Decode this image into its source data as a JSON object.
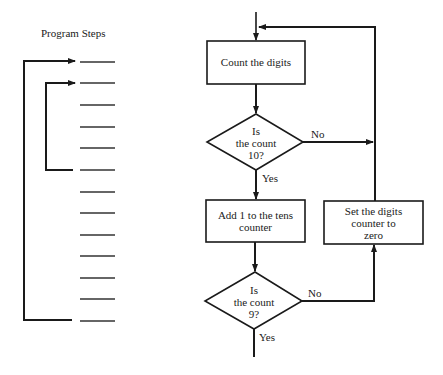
{
  "program_steps": {
    "title": "Program Steps",
    "step_count": 13,
    "step_y": [
      62,
      83,
      105,
      127,
      148,
      170,
      192,
      213,
      235,
      256,
      278,
      299,
      321
    ],
    "loops": [
      {
        "name": "outer-loop",
        "from_step": 13,
        "to_step": 1
      },
      {
        "name": "inner-loop",
        "from_step": 6,
        "to_step": 2
      }
    ]
  },
  "flowchart": {
    "nodes": {
      "count_digits": {
        "type": "process",
        "label": "Count the digits"
      },
      "is_count_10": {
        "type": "decision",
        "line1": "Is",
        "line2": "the count",
        "line3": "10?"
      },
      "add_tens": {
        "type": "process",
        "line1": "Add 1 to the tens",
        "line2": "counter"
      },
      "reset_digits": {
        "type": "process",
        "line1": "Set the digits",
        "line2": "counter to",
        "line3": "zero"
      },
      "is_count_9": {
        "type": "decision",
        "line1": "Is",
        "line2": "the count",
        "line3": "9?"
      }
    },
    "edge_labels": {
      "d1_no": "No",
      "d1_yes": "Yes",
      "d2_no": "No",
      "d2_yes": "Yes"
    }
  },
  "colors": {
    "line": "#1a1a1a",
    "background": "#ffffff"
  }
}
